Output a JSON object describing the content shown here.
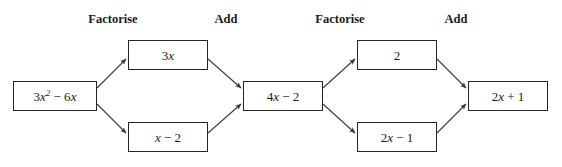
{
  "diagram": {
    "background_color": "#ffffff",
    "box_border_color": "#262626",
    "arrow_color": "#3a3a3a",
    "text_color": "#1a1a1a",
    "stage_labels": [
      {
        "id": "stage-factorise-1",
        "text": "Factorise",
        "x": 113,
        "y": 12
      },
      {
        "id": "stage-add-1",
        "text": "Add",
        "x": 226,
        "y": 12
      },
      {
        "id": "stage-factorise-2",
        "text": "Factorise",
        "x": 340,
        "y": 12
      },
      {
        "id": "stage-add-2",
        "text": "Add",
        "x": 456,
        "y": 12
      }
    ],
    "nodes": [
      {
        "id": "node-input",
        "name": "box-3x-squared-minus-6x",
        "text": "3x² − 6x",
        "x": 13,
        "y": 81,
        "w": 84,
        "h": 30
      },
      {
        "id": "node-3x",
        "name": "box-3x",
        "text": "3x",
        "x": 128,
        "y": 40,
        "w": 80,
        "h": 30
      },
      {
        "id": "node-x-minus-2",
        "name": "box-x-minus-2",
        "text": "x − 2",
        "x": 128,
        "y": 122,
        "w": 80,
        "h": 30
      },
      {
        "id": "node-4x-minus-2",
        "name": "box-4x-minus-2",
        "text": "4x − 2",
        "x": 243,
        "y": 81,
        "w": 80,
        "h": 30
      },
      {
        "id": "node-2",
        "name": "box-2",
        "text": "2",
        "x": 357,
        "y": 40,
        "w": 80,
        "h": 30
      },
      {
        "id": "node-2x-minus-1",
        "name": "box-2x-minus-1",
        "text": "2x − 1",
        "x": 357,
        "y": 122,
        "w": 80,
        "h": 30
      },
      {
        "id": "node-output",
        "name": "box-2x-plus-1",
        "text": "2x + 1",
        "x": 468,
        "y": 81,
        "w": 80,
        "h": 30
      }
    ],
    "edges": [
      {
        "id": "edge-input-to-3x",
        "from": "node-input",
        "to": "node-3x",
        "x1": 97,
        "y1": 88,
        "x2": 126,
        "y2": 59
      },
      {
        "id": "edge-input-to-x-minus-2",
        "from": "node-input",
        "to": "node-x-minus-2",
        "x1": 97,
        "y1": 104,
        "x2": 126,
        "y2": 133
      },
      {
        "id": "edge-3x-to-4x-minus-2",
        "from": "node-3x",
        "to": "node-4x-minus-2",
        "x1": 208,
        "y1": 59,
        "x2": 241,
        "y2": 88
      },
      {
        "id": "edge-x-minus-2-to-4x",
        "from": "node-x-minus-2",
        "to": "node-4x-minus-2",
        "x1": 208,
        "y1": 133,
        "x2": 241,
        "y2": 104
      },
      {
        "id": "edge-4x-to-2",
        "from": "node-4x-minus-2",
        "to": "node-2",
        "x1": 323,
        "y1": 88,
        "x2": 355,
        "y2": 59
      },
      {
        "id": "edge-4x-to-2x-minus-1",
        "from": "node-4x-minus-2",
        "to": "node-2x-minus-1",
        "x1": 323,
        "y1": 104,
        "x2": 355,
        "y2": 133
      },
      {
        "id": "edge-2-to-output",
        "from": "node-2",
        "to": "node-output",
        "x1": 437,
        "y1": 59,
        "x2": 466,
        "y2": 88
      },
      {
        "id": "edge-2x-minus-1-to-output",
        "from": "node-2x-minus-1",
        "to": "node-output",
        "x1": 437,
        "y1": 133,
        "x2": 466,
        "y2": 104
      }
    ]
  }
}
